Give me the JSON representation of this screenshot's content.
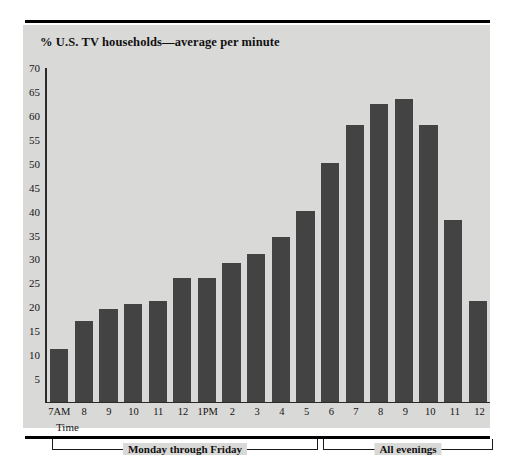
{
  "figure": {
    "title": "% U.S. TV households—average per minute",
    "time_label": "Time",
    "bar_color": "#434343",
    "panel_color": "#d9d9d7",
    "axis_color": "#2b2b2b"
  },
  "chart_data": {
    "type": "bar",
    "title": "% U.S. TV households—average per minute",
    "xlabel": "Time",
    "ylabel": "",
    "ylim": [
      0,
      70
    ],
    "yticks": [
      5,
      10,
      15,
      20,
      25,
      30,
      35,
      40,
      45,
      50,
      55,
      60,
      65,
      70
    ],
    "grid": false,
    "legend": null,
    "categories": [
      "7AM",
      "8",
      "9",
      "10",
      "11",
      "12",
      "1PM",
      "2",
      "3",
      "4",
      "5",
      "6",
      "7",
      "8",
      "9",
      "10",
      "11",
      "12"
    ],
    "values": [
      11,
      17,
      19.5,
      20.5,
      21,
      26,
      26,
      29,
      31,
      34.5,
      40,
      50,
      58,
      62.5,
      63.5,
      58,
      38,
      21
    ],
    "annotations": [
      {
        "text": "Monday through Friday",
        "from": "7AM",
        "to": "6"
      },
      {
        "text": "All evenings",
        "from": "7",
        "to": "12"
      }
    ]
  }
}
